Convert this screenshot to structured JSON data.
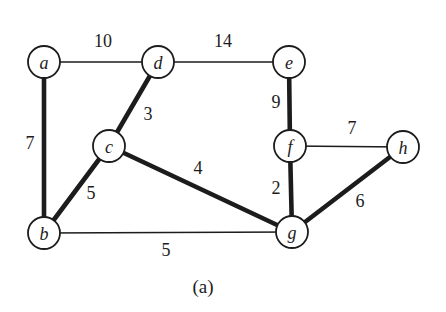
{
  "figure": {
    "caption": "(a)",
    "colors": {
      "background": "#ffffff",
      "ink": "#1c1c1c",
      "node_fill": "#ffffff"
    },
    "node_radius": 16,
    "node_stroke_width": 1.8,
    "thin_width": 1.6,
    "thick_width": 4.6,
    "nodes": [
      {
        "id": "a",
        "label": "a",
        "x": 44,
        "y": 62
      },
      {
        "id": "b",
        "label": "b",
        "x": 44,
        "y": 233
      },
      {
        "id": "c",
        "label": "c",
        "x": 109,
        "y": 146
      },
      {
        "id": "d",
        "label": "d",
        "x": 158,
        "y": 62
      },
      {
        "id": "e",
        "label": "e",
        "x": 289,
        "y": 62
      },
      {
        "id": "f",
        "label": "f",
        "x": 290,
        "y": 146
      },
      {
        "id": "g",
        "label": "g",
        "x": 292,
        "y": 232
      },
      {
        "id": "h",
        "label": "h",
        "x": 403,
        "y": 147
      }
    ],
    "edges": [
      {
        "from": "a",
        "to": "d",
        "weight": "10",
        "thick": false,
        "label_x": 103,
        "label_y": 41
      },
      {
        "from": "d",
        "to": "e",
        "weight": "14",
        "thick": false,
        "label_x": 223,
        "label_y": 41
      },
      {
        "from": "a",
        "to": "b",
        "weight": "7",
        "thick": true,
        "label_x": 30,
        "label_y": 143
      },
      {
        "from": "d",
        "to": "c",
        "weight": "3",
        "thick": true,
        "label_x": 148,
        "label_y": 114
      },
      {
        "from": "b",
        "to": "c",
        "weight": "5",
        "thick": true,
        "label_x": 91,
        "label_y": 193
      },
      {
        "from": "c",
        "to": "g",
        "weight": "4",
        "thick": true,
        "label_x": 198,
        "label_y": 168
      },
      {
        "from": "b",
        "to": "g",
        "weight": "5",
        "thick": false,
        "label_x": 166,
        "label_y": 250
      },
      {
        "from": "e",
        "to": "f",
        "weight": "9",
        "thick": true,
        "label_x": 276,
        "label_y": 102
      },
      {
        "from": "f",
        "to": "h",
        "weight": "7",
        "thick": false,
        "label_x": 352,
        "label_y": 128
      },
      {
        "from": "f",
        "to": "g",
        "weight": "2",
        "thick": true,
        "label_x": 276,
        "label_y": 188
      },
      {
        "from": "g",
        "to": "h",
        "weight": "6",
        "thick": true,
        "label_x": 360,
        "label_y": 201
      }
    ],
    "caption_x": 203,
    "caption_y": 293
  }
}
